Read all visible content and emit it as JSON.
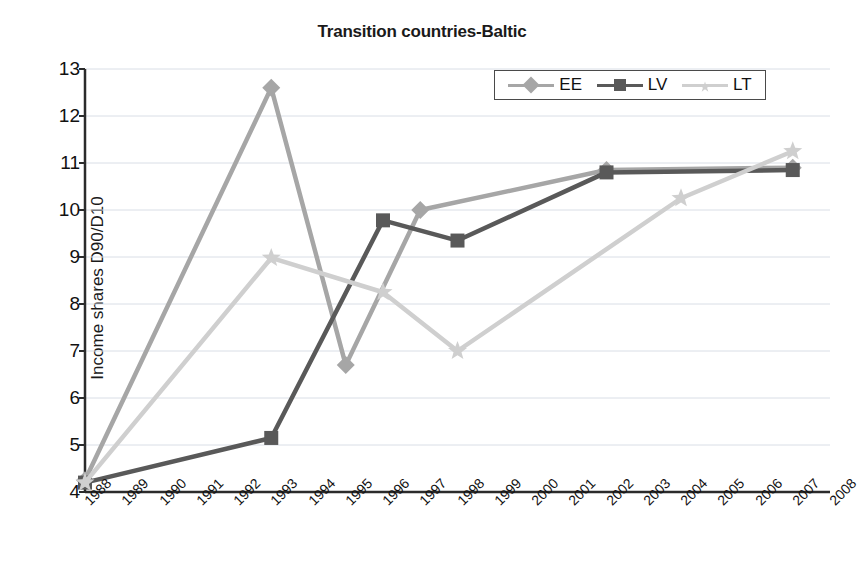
{
  "chart_data": {
    "type": "line",
    "title": "Transition countries-Baltic",
    "xlabel": "",
    "ylabel": "Income shares D90/D10",
    "ylim": [
      4,
      13
    ],
    "y_ticks": [
      4,
      5,
      6,
      7,
      8,
      9,
      10,
      11,
      12,
      13
    ],
    "grid": true,
    "legend_position": "top-right",
    "categories": [
      "1988",
      "1989",
      "1990",
      "1991",
      "1992",
      "1993",
      "1994",
      "1995",
      "1996",
      "1997",
      "1998",
      "1999",
      "2000",
      "2001",
      "2002",
      "2003",
      "2004",
      "2005",
      "2006",
      "2007",
      "2008"
    ],
    "series": [
      {
        "name": "EE",
        "color": "#a6a6a6",
        "marker": "diamond",
        "points": [
          {
            "x": "1988",
            "y": 4.25
          },
          {
            "x": "1993",
            "y": 12.6
          },
          {
            "x": "1995",
            "y": 6.7
          },
          {
            "x": "1997",
            "y": 10.0
          },
          {
            "x": "2002",
            "y": 10.85
          },
          {
            "x": "2007",
            "y": 10.9
          }
        ]
      },
      {
        "name": "LV",
        "color": "#595959",
        "marker": "square",
        "points": [
          {
            "x": "1988",
            "y": 4.2
          },
          {
            "x": "1993",
            "y": 5.15
          },
          {
            "x": "1996",
            "y": 9.78
          },
          {
            "x": "1998",
            "y": 9.35
          },
          {
            "x": "2002",
            "y": 10.8
          },
          {
            "x": "2007",
            "y": 10.85
          }
        ]
      },
      {
        "name": "LT",
        "color": "#cfcfcf",
        "marker": "star",
        "points": [
          {
            "x": "1988",
            "y": 4.2
          },
          {
            "x": "1993",
            "y": 8.98
          },
          {
            "x": "1996",
            "y": 8.25
          },
          {
            "x": "1998",
            "y": 7.0
          },
          {
            "x": "2004",
            "y": 10.25
          },
          {
            "x": "2007",
            "y": 11.25
          }
        ]
      }
    ],
    "legend": [
      {
        "label": "EE",
        "color": "#a6a6a6",
        "marker": "diamond"
      },
      {
        "label": "LV",
        "color": "#595959",
        "marker": "square"
      },
      {
        "label": "LT",
        "color": "#cfcfcf",
        "marker": "star"
      }
    ]
  }
}
